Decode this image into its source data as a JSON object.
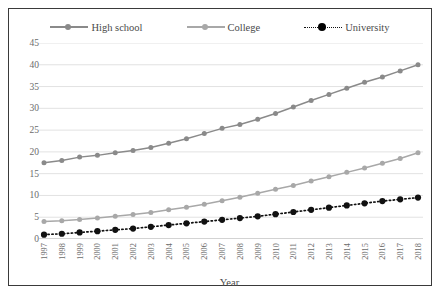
{
  "legend": {
    "items": [
      {
        "label": "High school",
        "color": "#8a8a8a",
        "style": "solid",
        "marker": "circle"
      },
      {
        "label": "College",
        "color": "#a8a8a8",
        "style": "solid",
        "marker": "circle"
      },
      {
        "label": "University",
        "color": "#111111",
        "style": "dotted",
        "marker": "circle-large"
      }
    ]
  },
  "axes": {
    "x_title": "Year",
    "y_ticks": [
      "45",
      "40",
      "35",
      "30",
      "25",
      "20",
      "15",
      "10",
      "5",
      "0"
    ]
  },
  "caption": "",
  "chart_data": {
    "type": "line",
    "title": "",
    "xlabel": "Year",
    "ylabel": "",
    "ylim": [
      0,
      45
    ],
    "ytick_step": 5,
    "grid": "horizontal",
    "legend_position": "top",
    "x": [
      "1997",
      "1998",
      "1999",
      "2000",
      "2001",
      "2002",
      "2003",
      "2004",
      "2005",
      "2006",
      "2007",
      "2008",
      "2009",
      "2010",
      "2011",
      "2012",
      "2013",
      "2014",
      "2015",
      "2016",
      "2017",
      "2018"
    ],
    "series": [
      {
        "name": "High school",
        "color": "#8a8a8a",
        "line_style": "solid",
        "values": [
          17.5,
          18.0,
          18.8,
          19.2,
          19.8,
          20.3,
          21.0,
          22.0,
          23.0,
          24.2,
          25.4,
          26.3,
          27.5,
          28.8,
          30.3,
          31.8,
          33.2,
          34.6,
          36.0,
          37.2,
          38.6,
          40.0
        ]
      },
      {
        "name": "College",
        "color": "#a8a8a8",
        "line_style": "solid",
        "values": [
          4.0,
          4.2,
          4.5,
          4.8,
          5.2,
          5.6,
          6.1,
          6.7,
          7.3,
          8.0,
          8.8,
          9.6,
          10.5,
          11.4,
          12.3,
          13.3,
          14.3,
          15.3,
          16.3,
          17.4,
          18.5,
          19.8
        ]
      },
      {
        "name": "University",
        "color": "#111111",
        "line_style": "dotted",
        "values": [
          1.0,
          1.2,
          1.5,
          1.8,
          2.1,
          2.4,
          2.8,
          3.2,
          3.6,
          4.0,
          4.4,
          4.8,
          5.2,
          5.7,
          6.2,
          6.7,
          7.2,
          7.7,
          8.2,
          8.7,
          9.1,
          9.5
        ]
      }
    ]
  }
}
